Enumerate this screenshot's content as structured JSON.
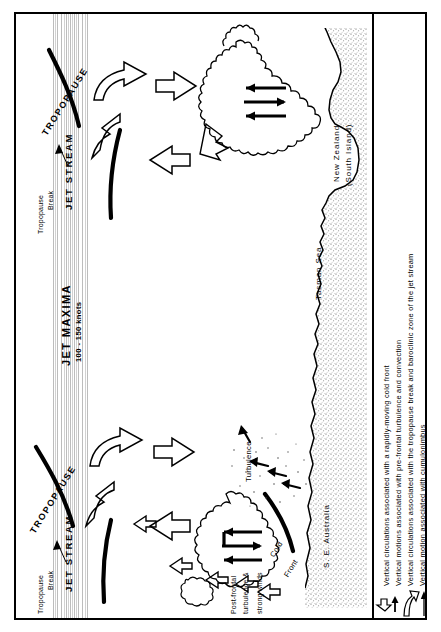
{
  "figure": {
    "type": "meteorological-cross-section",
    "orientation": "rotated-90-ccw",
    "region": "Tasman Sea between S.E. Australia and New Zealand"
  },
  "labels": {
    "tropopause": "TROPOPAUSE",
    "jet_stream": "JET STREAM",
    "tropopause_break": "Tropopause\nBreak",
    "tropopause_break_l1": "Tropopause",
    "tropopause_break_l2": "Break",
    "jet_maxima": "JET  MAXIMA",
    "jet_maxima_speed": "100 - 150 knots",
    "turbulence": "Turbulence",
    "cold_front_l1": "Cold",
    "cold_front_l2": "Front",
    "post_frontal_l1": "Post-frontal",
    "post_frontal_l2": "turbulence &",
    "post_frontal_l3": "strong winds",
    "tasman_sea": "Tasman Sea",
    "new_zealand_l1": "New Zealand",
    "new_zealand_l2": "(South Island)",
    "se_australia": "S. E. Australia"
  },
  "legend": {
    "items": [
      {
        "symbol": "open-chevron-arrow-icon",
        "text": "Vertical circulations associated with a rapidly-moving cold front"
      },
      {
        "symbol": "small-solid-arrow-icon",
        "text": "Vertical motions associated with pre-frontal turbulence and convection"
      },
      {
        "symbol": "large-open-curved-arrow-icon",
        "text": "Vertical circulations associated with the tropopause break and baroclinic zone of the jet stream"
      },
      {
        "symbol": "solid-line-arrow-icon",
        "text": "Vertical motion associated with cumulonimbus"
      }
    ]
  },
  "colors": {
    "ink": "#000000",
    "paper": "#ffffff",
    "stipple": "#7b7b7b",
    "jet_band": "#c4c4c4"
  }
}
